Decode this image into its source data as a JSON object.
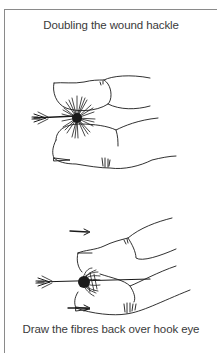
{
  "figure": {
    "caption_top": "Doubling the wound hackle",
    "caption_bottom": "Draw the fibres back over hook eye",
    "illustrations": [
      {
        "name": "fingers-holding-hackle",
        "description": "Two fingers with a bushy wound hackle at the fingertips on a hook shank"
      },
      {
        "name": "fingers-drawing-fibres-back",
        "description": "Two fingers stroking hackle fibres back over the hook eye, with arrows showing direction"
      }
    ],
    "colors": {
      "line": "#1a1a1a",
      "border": "#8a8a8a",
      "text": "#3a3a3a",
      "background": "#ffffff"
    }
  }
}
